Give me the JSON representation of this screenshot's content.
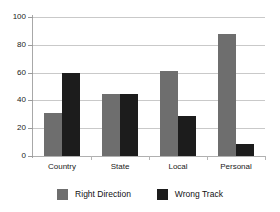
{
  "chart_data": {
    "type": "bar",
    "title": "",
    "subtitle": "",
    "xlabel": "",
    "ylabel": "",
    "categories": [
      "Country",
      "State",
      "Local",
      "Personal"
    ],
    "series": [
      {
        "name": "Right Direction",
        "color": "#6e6e6e",
        "values": [
          31,
          44.5,
          61,
          88
        ]
      },
      {
        "name": "Wrong Track",
        "color": "#1c1c1c",
        "values": [
          60,
          44.5,
          29,
          9
        ]
      }
    ],
    "ylim": [
      0,
      100
    ],
    "yticks": [
      0,
      20,
      40,
      60,
      80,
      100
    ],
    "ytick_labels": [
      "0",
      "20",
      "40",
      "60",
      "80",
      "100"
    ],
    "grid": true,
    "grid_axis": "y",
    "legend_position": "bottom",
    "legend": [
      "Right Direction",
      "Wrong Track"
    ],
    "annotations": []
  },
  "axis": {
    "y_labels": [
      "100",
      "80",
      "60",
      "40",
      "20",
      "0"
    ]
  },
  "legend": {
    "items": [
      {
        "label": "Right Direction"
      },
      {
        "label": "Wrong Track"
      }
    ]
  }
}
